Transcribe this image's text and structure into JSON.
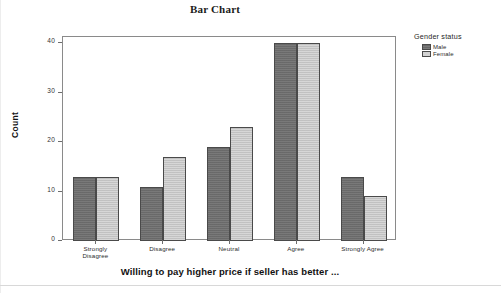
{
  "chart_data": {
    "type": "bar",
    "title": "Bar Chart",
    "xlabel": "Willing to pay higher price if seller has better ...",
    "ylabel": "Count",
    "categories": [
      "Strongly Disagree",
      "Disagree",
      "Neutral",
      "Agree",
      "Strongly Agree"
    ],
    "category_lines": [
      [
        "Strongly",
        "Disagree"
      ],
      [
        "Disagree"
      ],
      [
        "Neutral"
      ],
      [
        "Agree"
      ],
      [
        "Strongly Agree"
      ]
    ],
    "series": [
      {
        "name": "Male",
        "color": "#6f6f6f",
        "values": [
          13,
          11,
          19,
          40,
          13
        ]
      },
      {
        "name": "Female",
        "color": "#c9c9c9",
        "values": [
          13,
          17,
          23,
          40,
          9
        ]
      }
    ],
    "ylim": [
      0,
      42
    ],
    "yticks": [
      0,
      10,
      20,
      30,
      40
    ],
    "ytick_labels": [
      "0",
      "10",
      "20",
      "30",
      "40"
    ],
    "grid": false,
    "legend": {
      "title": "Gender status",
      "position": "right",
      "entries": [
        {
          "label": "Male",
          "swatch": "male"
        },
        {
          "label": "Female",
          "swatch": "female"
        }
      ]
    }
  }
}
